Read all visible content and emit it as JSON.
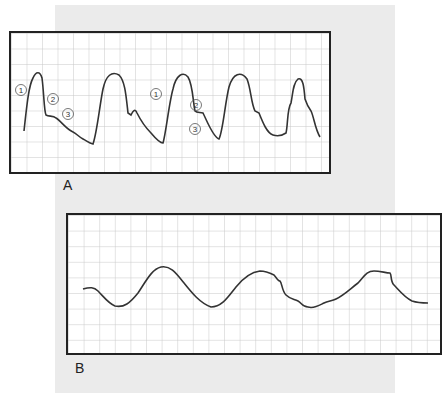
{
  "figure": {
    "panels": [
      {
        "id": "A",
        "label": "A",
        "description": "Arterial pressure waveform with labeled components",
        "markers": [
          "①",
          "②",
          "③",
          "①",
          "②",
          "③"
        ]
      },
      {
        "id": "B",
        "label": "B",
        "description": "Dampened arterial waveform"
      }
    ],
    "colors": {
      "background": "#ebebeb",
      "grid": "#c8c8c8",
      "trace": "#333333",
      "border": "#222222"
    }
  }
}
